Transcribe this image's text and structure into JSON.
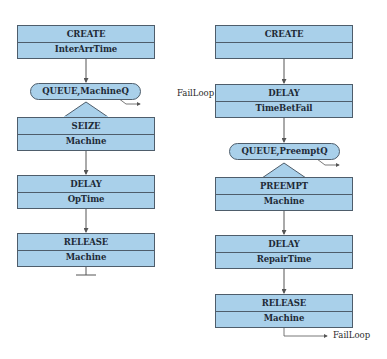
{
  "diagram": {
    "left": {
      "create": {
        "title": "CREATE",
        "operand": "InterArrTime"
      },
      "queue": {
        "label": "QUEUE,MachineQ"
      },
      "seize": {
        "title": "SEIZE",
        "operand": "Machine"
      },
      "delay": {
        "title": "DELAY",
        "operand": "OpTime"
      },
      "release": {
        "title": "RELEASE",
        "operand": "Machine"
      }
    },
    "right": {
      "create": {
        "title": "CREATE",
        "operand": ""
      },
      "loop_label": "FailLoop",
      "delay1": {
        "title": "DELAY",
        "operand": "TimeBetFail"
      },
      "queue": {
        "label": "QUEUE,PreemptQ"
      },
      "preempt": {
        "title": "PREEMPT",
        "operand": "Machine"
      },
      "delay2": {
        "title": "DELAY",
        "operand": "RepairTime"
      },
      "release": {
        "title": "RELEASE",
        "operand": "Machine"
      },
      "exit_label": "FailLoop"
    },
    "colors": {
      "block_fill": "#a9d0ea",
      "block_border": "#4e5d6b",
      "connector": "#555555"
    }
  }
}
